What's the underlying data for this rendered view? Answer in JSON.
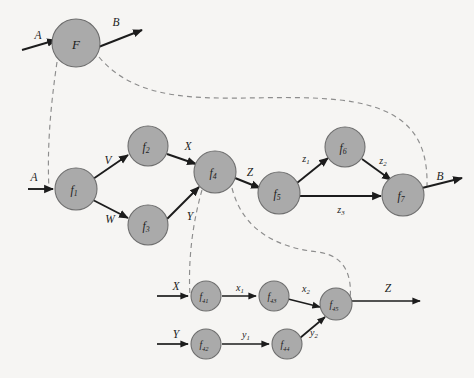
{
  "diagram": {
    "background_color": "#f6f5f3",
    "node_fill": "#aaaaaa",
    "node_stroke": "#6e6e6e",
    "edge_color": "#1c1c1c",
    "dashed_color": "#8d8d8d",
    "levels": [
      {
        "name": "top-level",
        "nodes": [
          {
            "id": "F",
            "label": "F",
            "sub": "",
            "cx": 76,
            "cy": 43,
            "r": 24,
            "size": "big"
          }
        ],
        "io": [
          {
            "name": "input-A",
            "label": "A",
            "lx": 38,
            "ly": 35
          },
          {
            "name": "output-B",
            "label": "B",
            "lx": 116,
            "ly": 22
          }
        ]
      },
      {
        "name": "middle-level",
        "nodes": [
          {
            "id": "f1",
            "label": "f",
            "sub": "1",
            "cx": 76,
            "cy": 189,
            "r": 21,
            "size": "mid"
          },
          {
            "id": "f2",
            "label": "f",
            "sub": "2",
            "cx": 148,
            "cy": 146,
            "r": 20,
            "size": "mid"
          },
          {
            "id": "f3",
            "label": "f",
            "sub": "3",
            "cx": 148,
            "cy": 225,
            "r": 20,
            "size": "mid"
          },
          {
            "id": "f4",
            "label": "f",
            "sub": "4",
            "cx": 215,
            "cy": 172,
            "r": 21,
            "size": "mid"
          },
          {
            "id": "f5",
            "label": "f",
            "sub": "5",
            "cx": 279,
            "cy": 193,
            "r": 21,
            "size": "mid"
          },
          {
            "id": "f6",
            "label": "f",
            "sub": "6",
            "cx": 345,
            "cy": 147,
            "r": 20,
            "size": "mid"
          },
          {
            "id": "f7",
            "label": "f",
            "sub": "7",
            "cx": 403,
            "cy": 195,
            "r": 21,
            "size": "mid"
          }
        ],
        "edge_labels": [
          {
            "name": "edge-label-V",
            "label": "V",
            "sub": "",
            "lx": 108,
            "ly": 160,
            "size": "cap"
          },
          {
            "name": "edge-label-W",
            "label": "W",
            "sub": "",
            "lx": 110,
            "ly": 219,
            "size": "cap"
          },
          {
            "name": "edge-label-X",
            "label": "X",
            "sub": "",
            "lx": 188,
            "ly": 146,
            "size": "cap"
          },
          {
            "name": "edge-label-Y",
            "label": "Y",
            "sub": "",
            "lx": 190,
            "ly": 216,
            "size": "cap"
          },
          {
            "name": "edge-label-Z",
            "label": "Z",
            "sub": "",
            "lx": 250,
            "ly": 172,
            "size": "cap"
          },
          {
            "name": "edge-label-z1",
            "label": "z",
            "sub": "1",
            "lx": 306,
            "ly": 158,
            "size": "low"
          },
          {
            "name": "edge-label-z2",
            "label": "z",
            "sub": "2",
            "lx": 383,
            "ly": 160,
            "size": "low"
          },
          {
            "name": "edge-label-z3",
            "label": "z",
            "sub": "3",
            "lx": 341,
            "ly": 209,
            "size": "low"
          }
        ],
        "io": [
          {
            "name": "input-A-mid",
            "label": "A",
            "lx": 34,
            "ly": 177
          },
          {
            "name": "output-B-mid",
            "label": "B",
            "lx": 440,
            "ly": 176
          }
        ]
      },
      {
        "name": "bottom-level",
        "nodes": [
          {
            "id": "f41",
            "label": "f",
            "sub": "41",
            "cx": 206,
            "cy": 296,
            "r": 15,
            "size": "small"
          },
          {
            "id": "f42",
            "label": "f",
            "sub": "42",
            "cx": 206,
            "cy": 344,
            "r": 15,
            "size": "small"
          },
          {
            "id": "f43",
            "label": "f",
            "sub": "43",
            "cx": 274,
            "cy": 296,
            "r": 15,
            "size": "small"
          },
          {
            "id": "f44",
            "label": "f",
            "sub": "44",
            "cx": 287,
            "cy": 344,
            "r": 15,
            "size": "small"
          },
          {
            "id": "f45",
            "label": "f",
            "sub": "45",
            "cx": 336,
            "cy": 304,
            "r": 16,
            "size": "small"
          }
        ],
        "edge_labels": [
          {
            "name": "edge-label-x1",
            "label": "x",
            "sub": "1",
            "lx": 240,
            "ly": 287,
            "size": "low"
          },
          {
            "name": "edge-label-x2",
            "label": "x",
            "sub": "2",
            "lx": 306,
            "ly": 288,
            "size": "low"
          },
          {
            "name": "edge-label-y1",
            "label": "y",
            "sub": "1",
            "lx": 246,
            "ly": 334,
            "size": "low"
          },
          {
            "name": "edge-label-y2",
            "label": "y",
            "sub": "2",
            "lx": 314,
            "ly": 332,
            "size": "low"
          }
        ],
        "io": [
          {
            "name": "input-X-bottom",
            "label": "X",
            "lx": 176,
            "ly": 286
          },
          {
            "name": "input-Y-bottom",
            "label": "Y",
            "lx": 176,
            "ly": 334
          },
          {
            "name": "output-Z-bottom",
            "label": "Z",
            "lx": 388,
            "ly": 288
          }
        ]
      }
    ]
  }
}
